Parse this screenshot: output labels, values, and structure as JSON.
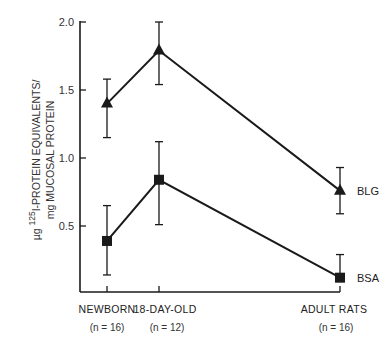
{
  "chart_data": {
    "type": "line",
    "title": "",
    "xlabel": "",
    "ylabel_line1_prefix": "µg",
    "ylabel_superscript": "125",
    "ylabel_line1": "I-PROTEIN EQUIVALENTS/",
    "ylabel_line2": "mg MUCOSAL PROTEIN",
    "ylim": [
      0,
      2.0
    ],
    "yticks": [
      "0.5",
      "1.0",
      "1.5",
      "2.0"
    ],
    "ytick_values": [
      0.5,
      1.0,
      1.5,
      2.0
    ],
    "grid": false,
    "legend_position": "inline-right",
    "categories": [
      "NEWBORN",
      "18-DAY-OLD",
      "ADULT RATS"
    ],
    "category_n": [
      "(n = 16)",
      "(n = 12)",
      "(n = 16)"
    ],
    "series": [
      {
        "name": "BLG",
        "marker": "triangle",
        "values": [
          1.4,
          1.79,
          0.76
        ],
        "error_upper": [
          1.58,
          2.0,
          0.93
        ],
        "error_lower": [
          1.15,
          1.54,
          0.59
        ]
      },
      {
        "name": "BSA",
        "marker": "square",
        "values": [
          0.39,
          0.84,
          0.12
        ],
        "error_upper": [
          0.65,
          1.12,
          0.29
        ],
        "error_lower": [
          0.14,
          0.51,
          0.12
        ]
      }
    ]
  },
  "colors": {
    "ink": "#1a1a1a",
    "background": "#ffffff"
  }
}
